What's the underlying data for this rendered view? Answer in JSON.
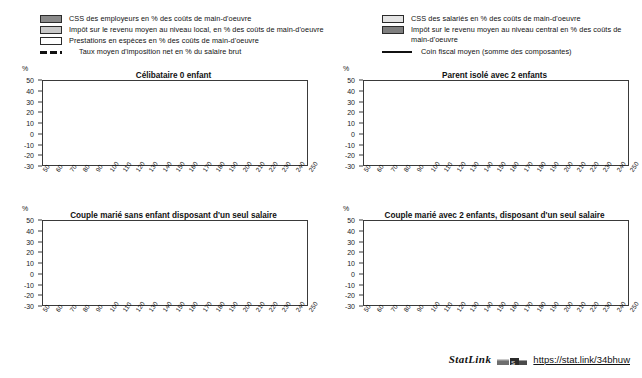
{
  "legend": {
    "left_items": [
      {
        "swatch": "dark-gray-swatch",
        "label": "CSS des employeurs en % des coûts de main-d'oeuvre"
      },
      {
        "swatch": "mid-gray-swatch",
        "label": "Impôt sur le revenu moyen au niveau local, en % des coûts de main-d'oeuvre"
      },
      {
        "swatch": "white-swatch",
        "label": "Prestations en espèces en % des coûts de main-d'oeuvre"
      }
    ],
    "left_line": {
      "key": "dashed-line-key",
      "label": "Taux moyen d'imposition net en % du salaire brut"
    },
    "right_items": [
      {
        "swatch": "very-light-gray-swatch",
        "label": "CSS des salariés en % des coûts de main-d'oeuvre"
      },
      {
        "swatch": "dark-gray-swatch",
        "label": "Impôt sur le revenu moyen au niveau central en %  des coûts de main-d'oeuvre"
      }
    ],
    "right_line": {
      "key": "solid-line-key",
      "label": "Coin fiscal moyen (somme des composantes)"
    }
  },
  "axis": {
    "unit": "%",
    "y_ticks": [
      50,
      40,
      30,
      20,
      10,
      0,
      -10,
      -20,
      -30
    ],
    "x_ticks": [
      50,
      60,
      70,
      80,
      90,
      100,
      110,
      120,
      130,
      140,
      150,
      160,
      170,
      180,
      190,
      200,
      210,
      220,
      230,
      240,
      250
    ]
  },
  "statlink": {
    "word": "StatLink",
    "badge": "statlink-logo-icon",
    "url": "https://stat.link/34bhuw"
  },
  "colors": {
    "employer_scc": "#8a8a8a",
    "local_income_tax": "#c9c9c9",
    "cash_benefits": "#ffffff",
    "employee_scc": "#e4e4e4",
    "central_income_tax": "#7f7f7f",
    "net_rate_line": "#111111",
    "tax_wedge_line": "#111111",
    "frame": "#3a3a3a"
  },
  "chart_data": [
    {
      "type": "area",
      "id": "celibataire-0-enfant",
      "title": "Célibataire 0 enfant",
      "xlabel": "",
      "ylabel": "%",
      "xlim": [
        50,
        250
      ],
      "ylim": [
        -30,
        50
      ],
      "grid": false,
      "legend_position": "top",
      "x": [
        50,
        60,
        70,
        80,
        90,
        100,
        110,
        120,
        130,
        140,
        150,
        160,
        170,
        180,
        190,
        200,
        210,
        220,
        230,
        240,
        250
      ],
      "series": [
        {
          "name": "CSS des employeurs en % des coûts de main-d'oeuvre",
          "stack": "positive",
          "values": [
            23.5,
            23.5,
            23.5,
            23.5,
            23.5,
            23.5,
            23.5,
            23.5,
            23.5,
            23.5,
            23.5,
            23.5,
            23.5,
            23.5,
            23.5,
            23.5,
            23.5,
            23.5,
            23.5,
            23.5,
            23.5
          ]
        },
        {
          "name": "CSS des salariés en % des coûts de main-d'oeuvre",
          "stack": "positive",
          "values": [
            1.5,
            1.5,
            1.5,
            1.5,
            1.5,
            1.5,
            1.5,
            1.5,
            1.5,
            1.5,
            1.5,
            1.5,
            1.5,
            1.5,
            1.5,
            1.5,
            1.5,
            1.5,
            1.5,
            1.5,
            1.5
          ]
        },
        {
          "name": "Impôt sur le revenu moyen au niveau local, en % des coûts de main-d'oeuvre",
          "stack": "positive",
          "values": [
            5.0,
            5.2,
            5.4,
            5.5,
            5.6,
            5.7,
            5.8,
            5.8,
            5.9,
            5.9,
            6.0,
            6.0,
            6.0,
            6.1,
            6.1,
            6.1,
            6.1,
            6.1,
            6.2,
            6.2,
            6.2
          ]
        },
        {
          "name": "Impôt sur le revenu moyen au niveau central en %  des coûts de main-d'oeuvre",
          "stack": "positive",
          "values": [
            5.0,
            6.8,
            8.0,
            8.9,
            9.5,
            10.0,
            10.4,
            10.7,
            11.0,
            11.2,
            11.4,
            11.5,
            11.6,
            11.7,
            11.8,
            11.9,
            12.0,
            12.0,
            12.1,
            12.1,
            12.2
          ]
        },
        {
          "name": "Prestations en espèces en % des coûts de main-d'oeuvre",
          "stack": "negative",
          "values": [
            0,
            0,
            0,
            0,
            0,
            0,
            0,
            0,
            0,
            0,
            0,
            0,
            0,
            0,
            0,
            0,
            0,
            0,
            0,
            0,
            0
          ]
        }
      ],
      "lines": [
        {
          "name": "Coin fiscal moyen (somme des composantes)",
          "style": "solid",
          "values": [
            35.0,
            37.0,
            38.4,
            39.4,
            40.1,
            40.7,
            41.2,
            41.5,
            41.9,
            42.1,
            42.4,
            42.5,
            42.6,
            42.8,
            42.9,
            43.0,
            43.1,
            43.1,
            43.3,
            43.3,
            43.4
          ]
        },
        {
          "name": "Taux moyen d'imposition net en % du salaire brut",
          "style": "dashed",
          "values": [
            13.5,
            16.0,
            17.8,
            19.0,
            19.9,
            20.6,
            21.2,
            21.5,
            21.9,
            22.2,
            22.5,
            22.6,
            22.8,
            23.0,
            23.1,
            23.2,
            23.3,
            23.4,
            23.6,
            23.6,
            23.7
          ]
        }
      ]
    },
    {
      "type": "area",
      "id": "parent-isole-2-enfants",
      "title": "Parent isolé avec 2 enfants",
      "xlabel": "",
      "ylabel": "%",
      "xlim": [
        50,
        250
      ],
      "ylim": [
        -30,
        50
      ],
      "grid": false,
      "legend_position": "top",
      "x": [
        50,
        60,
        70,
        80,
        90,
        100,
        110,
        120,
        130,
        140,
        150,
        160,
        170,
        180,
        190,
        200,
        210,
        220,
        230,
        240,
        250
      ],
      "series": [
        {
          "name": "CSS des employeurs en % des coûts de main-d'oeuvre",
          "stack": "positive",
          "values": [
            20.0,
            21.0,
            22.0,
            22.5,
            23.0,
            23.2,
            23.3,
            23.4,
            23.4,
            23.5,
            23.5,
            23.5,
            23.5,
            23.5,
            23.5,
            23.5,
            23.5,
            23.5,
            23.5,
            23.5,
            23.5
          ]
        },
        {
          "name": "CSS des salariés en % des coûts de main-d'oeuvre",
          "stack": "positive",
          "values": [
            1.5,
            1.5,
            1.5,
            1.5,
            1.5,
            1.5,
            1.5,
            1.5,
            1.5,
            1.5,
            1.5,
            1.5,
            1.5,
            1.5,
            1.5,
            1.5,
            1.5,
            1.5,
            1.5,
            1.5,
            1.5
          ]
        },
        {
          "name": "Impôt sur le revenu moyen au niveau local, en % des coûts de main-d'oeuvre",
          "stack": "positive",
          "values": [
            9.0,
            8.4,
            7.9,
            7.5,
            7.2,
            7.0,
            6.8,
            6.7,
            6.6,
            6.5,
            6.4,
            6.4,
            6.3,
            6.3,
            6.3,
            6.2,
            6.2,
            6.2,
            6.2,
            6.2,
            6.2
          ]
        },
        {
          "name": "Impôt sur le revenu moyen au niveau central en %  des coûts de main-d'oeuvre",
          "stack": "positive",
          "values": [
            0.5,
            1.0,
            2.0,
            3.2,
            4.4,
            5.4,
            6.2,
            6.9,
            7.5,
            8.0,
            8.4,
            8.8,
            9.1,
            9.4,
            9.6,
            9.8,
            11.4,
            11.8,
            12.0,
            12.1,
            12.2
          ]
        },
        {
          "name": "Prestations en espèces en % des coûts de main-d'oeuvre",
          "stack": "negative",
          "values": [
            -21.0,
            -16.5,
            -13.0,
            -10.4,
            -8.3,
            -6.7,
            -5.4,
            -4.4,
            -3.6,
            -2.9,
            -2.4,
            -2.0,
            -1.6,
            -1.3,
            -1.1,
            -0.9,
            0,
            0,
            0,
            0,
            0
          ]
        }
      ],
      "lines": [
        {
          "name": "Coin fiscal moyen (somme des composantes)",
          "style": "solid",
          "values": [
            10.0,
            15.5,
            19.5,
            22.5,
            24.8,
            26.6,
            28.1,
            29.3,
            30.3,
            31.2,
            31.9,
            32.5,
            33.1,
            33.6,
            34.0,
            34.4,
            36.6,
            37.2,
            37.6,
            37.9,
            38.2
          ]
        },
        {
          "name": "Taux moyen d'imposition net en % du salaire brut",
          "style": "dashed",
          "values": [
            -20.0,
            -13.5,
            -8.6,
            -5.0,
            -2.2,
            0.1,
            1.9,
            3.4,
            4.7,
            5.8,
            6.8,
            7.6,
            8.3,
            8.9,
            9.5,
            10.0,
            13.5,
            14.6,
            15.3,
            15.8,
            16.2
          ]
        }
      ]
    },
    {
      "type": "area",
      "id": "couple-marie-sans-enfant",
      "title": "Couple marié sans enfant disposant d'un seul salaire",
      "xlabel": "",
      "ylabel": "%",
      "xlim": [
        50,
        250
      ],
      "ylim": [
        -30,
        50
      ],
      "grid": false,
      "legend_position": "top",
      "x": [
        50,
        60,
        70,
        80,
        90,
        100,
        110,
        120,
        130,
        140,
        150,
        160,
        170,
        180,
        190,
        200,
        210,
        220,
        230,
        240,
        250
      ],
      "series": [
        {
          "name": "CSS des employeurs en % des coûts de main-d'oeuvre",
          "stack": "positive",
          "values": [
            23.5,
            23.5,
            23.5,
            23.5,
            23.5,
            23.5,
            23.5,
            23.5,
            23.5,
            23.5,
            23.5,
            23.5,
            23.5,
            23.5,
            23.5,
            23.5,
            23.5,
            23.5,
            23.5,
            23.5,
            23.5
          ]
        },
        {
          "name": "CSS des salariés en % des coûts de main-d'oeuvre",
          "stack": "positive",
          "values": [
            1.5,
            1.5,
            1.5,
            1.5,
            1.5,
            1.5,
            1.5,
            1.5,
            1.5,
            1.5,
            1.5,
            1.5,
            1.5,
            1.5,
            1.5,
            1.5,
            1.5,
            1.5,
            1.5,
            1.5,
            1.5
          ]
        },
        {
          "name": "Impôt sur le revenu moyen au niveau local, en % des coûts de main-d'oeuvre",
          "stack": "positive",
          "values": [
            8.0,
            7.6,
            7.2,
            6.9,
            6.7,
            6.6,
            6.4,
            6.4,
            6.3,
            6.3,
            6.2,
            6.2,
            6.2,
            6.2,
            6.2,
            6.2,
            6.2,
            6.2,
            6.2,
            6.2,
            6.2
          ]
        },
        {
          "name": "Impôt sur le revenu moyen au niveau central en %  des coûts de main-d'oeuvre",
          "stack": "positive",
          "values": [
            0.5,
            0.6,
            0.8,
            1.5,
            3.0,
            4.3,
            5.4,
            6.3,
            7.0,
            7.6,
            8.1,
            8.5,
            8.9,
            9.2,
            9.5,
            9.7,
            9.9,
            10.1,
            10.3,
            10.4,
            10.5
          ]
        },
        {
          "name": "Prestations en espèces en % des coûts de main-d'oeuvre",
          "stack": "negative",
          "values": [
            0,
            0,
            0,
            0,
            0,
            0,
            0,
            0,
            0,
            0,
            0,
            0,
            0,
            0,
            0,
            0,
            0,
            0,
            0,
            0,
            0
          ]
        }
      ],
      "lines": [
        {
          "name": "Coin fiscal moyen (somme des composantes)",
          "style": "solid",
          "values": [
            33.5,
            33.2,
            33.0,
            33.4,
            34.7,
            35.9,
            36.8,
            37.7,
            38.3,
            38.9,
            39.3,
            39.7,
            40.1,
            40.4,
            40.7,
            40.9,
            41.1,
            41.3,
            41.5,
            41.6,
            41.7
          ]
        },
        {
          "name": "Taux moyen d'imposition net en % du salaire brut",
          "style": "dashed",
          "values": [
            11.0,
            11.0,
            11.0,
            11.5,
            13.2,
            14.8,
            16.0,
            17.1,
            18.0,
            18.7,
            19.2,
            19.7,
            20.2,
            20.6,
            20.9,
            21.2,
            21.5,
            21.7,
            21.9,
            22.1,
            22.2
          ]
        }
      ]
    },
    {
      "type": "area",
      "id": "couple-marie-2-enfants",
      "title": "Couple marié avec 2 enfants, disposant d'un seul salaire",
      "xlabel": "",
      "ylabel": "%",
      "xlim": [
        50,
        250
      ],
      "ylim": [
        -30,
        50
      ],
      "grid": false,
      "legend_position": "top",
      "x": [
        50,
        60,
        70,
        80,
        90,
        100,
        110,
        120,
        130,
        140,
        150,
        160,
        170,
        180,
        190,
        200,
        210,
        220,
        230,
        240,
        250
      ],
      "series": [
        {
          "name": "CSS des employeurs en % des coûts de main-d'oeuvre",
          "stack": "positive",
          "values": [
            20.0,
            21.0,
            22.0,
            22.6,
            23.0,
            23.2,
            23.3,
            23.4,
            23.4,
            23.5,
            23.5,
            23.5,
            23.5,
            23.5,
            23.5,
            23.5,
            23.5,
            23.5,
            23.5,
            23.5,
            23.5
          ]
        },
        {
          "name": "CSS des salariés en % des coûts de main-d'oeuvre",
          "stack": "positive",
          "values": [
            1.5,
            1.5,
            1.5,
            1.5,
            1.5,
            1.5,
            1.5,
            1.5,
            1.5,
            1.5,
            1.5,
            1.5,
            1.5,
            1.5,
            1.5,
            1.5,
            1.5,
            1.5,
            1.5,
            1.5,
            1.5
          ]
        },
        {
          "name": "Impôt sur le revenu moyen au niveau local, en % des coûts de main-d'oeuvre",
          "stack": "positive",
          "values": [
            9.0,
            8.4,
            7.9,
            7.5,
            7.2,
            7.0,
            6.8,
            6.7,
            6.6,
            6.5,
            6.4,
            6.4,
            6.3,
            6.3,
            6.3,
            6.2,
            6.2,
            6.2,
            6.2,
            6.2,
            6.2
          ]
        },
        {
          "name": "Impôt sur le revenu moyen au niveau central en %  des coûts de main-d'oeuvre",
          "stack": "positive",
          "values": [
            0.3,
            0.5,
            0.8,
            1.2,
            1.9,
            2.7,
            3.5,
            4.2,
            4.8,
            5.3,
            5.7,
            6.1,
            6.4,
            6.7,
            6.9,
            7.1,
            7.3,
            7.4,
            7.5,
            7.6,
            7.7
          ]
        },
        {
          "name": "Prestations en espèces en % des coûts de main-d'oeuvre",
          "stack": "negative",
          "values": [
            -21.5,
            -17.2,
            -13.8,
            -11.2,
            -9.2,
            -7.6,
            -6.3,
            -5.2,
            -4.4,
            -3.7,
            -3.1,
            -2.7,
            -2.3,
            -2.0,
            -1.7,
            -1.5,
            -1.3,
            -1.2,
            -1.0,
            -0.9,
            -0.8
          ]
        }
      ],
      "lines": [
        {
          "name": "Coin fiscal moyen (somme des composantes)",
          "style": "solid",
          "values": [
            9.5,
            14.2,
            18.2,
            21.1,
            23.4,
            25.3,
            26.8,
            28.1,
            29.2,
            30.1,
            30.9,
            31.6,
            32.2,
            32.7,
            33.2,
            33.6,
            34.0,
            34.3,
            34.6,
            34.9,
            35.1
          ]
        },
        {
          "name": "Taux moyen d'imposition net en % du salaire brut",
          "style": "dashed",
          "values": [
            -21.0,
            -15.0,
            -10.5,
            -7.0,
            -4.3,
            -2.1,
            -0.3,
            1.2,
            2.5,
            3.6,
            4.6,
            5.4,
            6.1,
            6.8,
            7.4,
            7.9,
            8.3,
            8.7,
            9.1,
            9.4,
            9.7
          ]
        }
      ]
    }
  ]
}
